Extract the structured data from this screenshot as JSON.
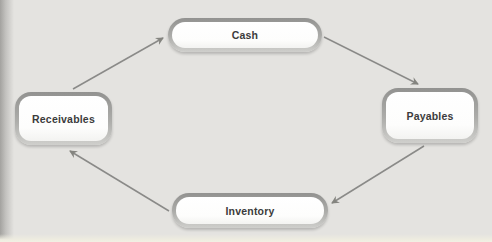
{
  "diagram": {
    "nodes": [
      {
        "id": "cash",
        "label": "Cash"
      },
      {
        "id": "payables",
        "label": "Payables"
      },
      {
        "id": "inventory",
        "label": "Inventory"
      },
      {
        "id": "receivables",
        "label": "Receivables"
      }
    ],
    "edges": [
      {
        "from": "receivables",
        "to": "cash"
      },
      {
        "from": "cash",
        "to": "payables"
      },
      {
        "from": "payables",
        "to": "inventory"
      },
      {
        "from": "inventory",
        "to": "receivables"
      }
    ],
    "colors": {
      "background": "#e4e3e0",
      "node_fill": "#ffffff",
      "node_border": "#9a9a97",
      "arrow": "#8a8a88",
      "text": "#3b3b3b"
    }
  }
}
